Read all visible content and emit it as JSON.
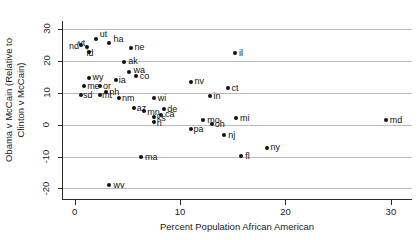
{
  "chart_data": {
    "type": "scatter",
    "title": "",
    "xlabel": "Percent Population African American",
    "ylabel": "Obama v McCain (Relative to Clinton v McCain)",
    "ylabel_line1": "Obama v McCain (Relative to",
    "ylabel_line2": "Clinton v McCain)",
    "xlim": [
      -1.2,
      32.0
    ],
    "ylim": [
      -23.0,
      32.5
    ],
    "xticks": [
      0,
      10,
      20,
      30
    ],
    "yticks": [
      30,
      20,
      10,
      0,
      -10,
      -20
    ],
    "xtick_labels": [
      "0",
      "10",
      "20",
      "30"
    ],
    "ytick_labels": [
      "30",
      "20",
      "10",
      "0",
      "-10",
      "-20"
    ],
    "grid": true,
    "grid_axis": "y",
    "legend": "none",
    "point_color": "#111111",
    "grid_color": "#b9b9b9",
    "axis_color": "#2a2a2a",
    "points": [
      {
        "label": "nd",
        "x": 0.6,
        "y": 25.0,
        "lx": -12,
        "ly": -3
      },
      {
        "label": "ut",
        "x": 2.0,
        "y": 27.0,
        "lx": 4,
        "ly": -9
      },
      {
        "label": "vt",
        "x": 1.2,
        "y": 24.3,
        "lx": -9,
        "ly": -8
      },
      {
        "label": "id",
        "x": 1.4,
        "y": 22.8,
        "lx": -3,
        "ly": -3
      },
      {
        "label": "ha",
        "x": 3.3,
        "y": 25.7,
        "lx": 4,
        "ly": -8
      },
      {
        "label": "ne",
        "x": 5.3,
        "y": 24.0,
        "lx": 4,
        "ly": -5
      },
      {
        "label": "ak",
        "x": 4.7,
        "y": 19.6,
        "lx": 4,
        "ly": -5
      },
      {
        "label": "wa",
        "x": 5.2,
        "y": 16.6,
        "lx": 4,
        "ly": -6
      },
      {
        "label": "co",
        "x": 5.8,
        "y": 15.2,
        "lx": 4,
        "ly": -4
      },
      {
        "label": "wy",
        "x": 1.4,
        "y": 14.6,
        "lx": 3,
        "ly": -5
      },
      {
        "label": "ia",
        "x": 3.9,
        "y": 14.1,
        "lx": 3,
        "ly": -4
      },
      {
        "label": "me",
        "x": 0.9,
        "y": 12.0,
        "lx": 3,
        "ly": -4
      },
      {
        "label": "or",
        "x": 2.4,
        "y": 12.0,
        "lx": 3,
        "ly": -4
      },
      {
        "label": "nh",
        "x": 3.0,
        "y": 10.3,
        "lx": 3,
        "ly": -4
      },
      {
        "label": "sd",
        "x": 0.6,
        "y": 9.2,
        "lx": 2,
        "ly": -4
      },
      {
        "label": "mt",
        "x": 2.4,
        "y": 9.2,
        "lx": 2,
        "ly": -4
      },
      {
        "label": "nm",
        "x": 4.2,
        "y": 8.3,
        "lx": 3,
        "ly": -4
      },
      {
        "label": "nv",
        "x": 11.0,
        "y": 13.5,
        "lx": 4,
        "ly": -5
      },
      {
        "label": "ct",
        "x": 14.5,
        "y": 11.6,
        "lx": 4,
        "ly": -4
      },
      {
        "label": "in",
        "x": 12.8,
        "y": 9.0,
        "lx": 4,
        "ly": -4
      },
      {
        "label": "wi",
        "x": 7.5,
        "y": 8.4,
        "lx": 4,
        "ly": -4
      },
      {
        "label": "il",
        "x": 15.2,
        "y": 22.6,
        "lx": 4,
        "ly": -4
      },
      {
        "label": "az",
        "x": 5.6,
        "y": 5.2,
        "lx": 3,
        "ly": -4
      },
      {
        "label": "mn",
        "x": 6.6,
        "y": 4.4,
        "lx": 3,
        "ly": -3
      },
      {
        "label": "de",
        "x": 8.5,
        "y": 4.9,
        "lx": 3,
        "ly": -4
      },
      {
        "label": "ks",
        "x": 7.5,
        "y": 2.5,
        "lx": 3,
        "ly": -3
      },
      {
        "label": "ca",
        "x": 8.2,
        "y": 2.9,
        "lx": 4,
        "ly": -5
      },
      {
        "label": "ri",
        "x": 7.5,
        "y": 0.7,
        "lx": 3,
        "ly": -3
      },
      {
        "label": "mo",
        "x": 12.2,
        "y": 1.6,
        "lx": 4,
        "ly": -4
      },
      {
        "label": "mi",
        "x": 15.3,
        "y": 2.0,
        "lx": 4,
        "ly": -4
      },
      {
        "label": "oh",
        "x": 13.0,
        "y": 0.3,
        "lx": 3,
        "ly": -4
      },
      {
        "label": "pa",
        "x": 11.0,
        "y": -1.4,
        "lx": 3,
        "ly": -4
      },
      {
        "label": "nj",
        "x": 14.2,
        "y": -3.4,
        "lx": 4,
        "ly": -4
      },
      {
        "label": "ny",
        "x": 18.2,
        "y": -7.4,
        "lx": 4,
        "ly": -5
      },
      {
        "label": "fl",
        "x": 15.8,
        "y": -9.8,
        "lx": 4,
        "ly": -4
      },
      {
        "label": "ma",
        "x": 6.3,
        "y": -10.0,
        "lx": 4,
        "ly": -4
      },
      {
        "label": "wv",
        "x": 3.3,
        "y": -19.0,
        "lx": 4,
        "ly": -4
      },
      {
        "label": "md",
        "x": 29.5,
        "y": 1.4,
        "lx": 4,
        "ly": -4
      }
    ]
  }
}
